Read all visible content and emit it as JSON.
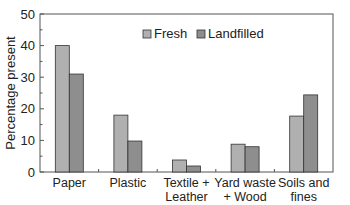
{
  "chart_data": {
    "type": "bar",
    "title": "",
    "xlabel": "",
    "ylabel": "Percentage present",
    "ylim": [
      0,
      50
    ],
    "yticks": [
      0,
      10,
      20,
      30,
      40,
      50
    ],
    "grid": false,
    "legend_position": "top-center-inside",
    "categories": [
      "Paper",
      "Plastic",
      "Textile + Leather",
      "Yard waste + Wood",
      "Soils and fines"
    ],
    "category_lines": [
      [
        "Paper"
      ],
      [
        "Plastic"
      ],
      [
        "Textile +",
        "Leather"
      ],
      [
        "Yard waste",
        "+ Wood"
      ],
      [
        "Soils and",
        "fines"
      ]
    ],
    "series": [
      {
        "name": "Fresh",
        "color": "#b0b0b0",
        "values": [
          40,
          18,
          3.8,
          8.8,
          17.7
        ]
      },
      {
        "name": "Landfilled",
        "color": "#8e8e8e",
        "values": [
          31,
          9.8,
          1.9,
          8,
          24.4
        ]
      }
    ]
  }
}
